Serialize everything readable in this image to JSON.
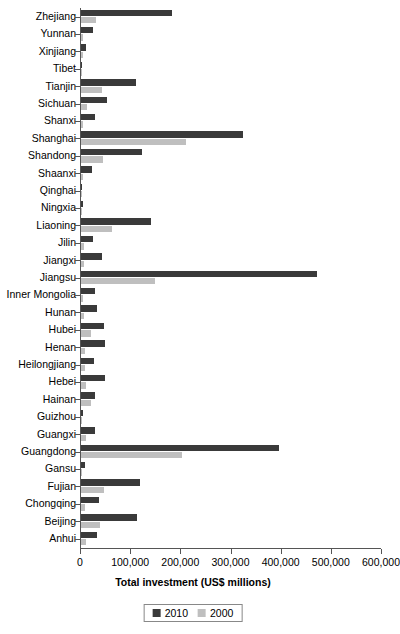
{
  "chart_data": {
    "type": "bar",
    "orientation": "horizontal",
    "title": "",
    "xlabel": "Total investment (US$ millions)",
    "ylabel": "",
    "xlim": [
      0,
      600000
    ],
    "xticks": [
      0,
      100000,
      200000,
      300000,
      400000,
      500000,
      600000
    ],
    "xtick_labels": [
      "0",
      "100,000",
      "200,000",
      "300,000",
      "400,000",
      "500,000",
      "600,000"
    ],
    "grid": false,
    "legend_position": "bottom-center",
    "categories": [
      "Zhejiang",
      "Yunnan",
      "Xinjiang",
      "Tibet",
      "Tianjin",
      "Sichuan",
      "Shanxi",
      "Shanghai",
      "Shandong",
      "Shaanxi",
      "Qinghai",
      "Ningxia",
      "Liaoning",
      "Jilin",
      "Jiangxi",
      "Jiangsu",
      "Inner Mongolia",
      "Hunan",
      "Hubei",
      "Henan",
      "Heilongjiang",
      "Hebei",
      "Hainan",
      "Guizhou",
      "Guangxi",
      "Guangdong",
      "Gansu",
      "Fujian",
      "Chongqing",
      "Beijing",
      "Anhui"
    ],
    "series": [
      {
        "name": "2010",
        "color": "#3a3a3a",
        "values": [
          182000,
          24000,
          9000,
          1500,
          110000,
          52000,
          27000,
          322000,
          122000,
          22000,
          2500,
          4000,
          140000,
          24000,
          42000,
          470000,
          27000,
          31000,
          46000,
          48000,
          26000,
          47000,
          28000,
          3000,
          28000,
          394000,
          7000,
          118000,
          35000,
          112000,
          32000
        ]
      },
      {
        "name": "2000",
        "color": "#bfbfbf",
        "values": [
          30000,
          4000,
          3000,
          400,
          42000,
          12000,
          4000,
          210000,
          44000,
          4000,
          600,
          1000,
          62000,
          6000,
          6000,
          148000,
          4000,
          5000,
          20000,
          7000,
          8000,
          10000,
          20000,
          1500,
          9000,
          202000,
          2500,
          46000,
          8000,
          38000,
          9000
        ]
      }
    ]
  },
  "legend": {
    "items": [
      {
        "label": "2010",
        "color": "#3a3a3a"
      },
      {
        "label": "2000",
        "color": "#bfbfbf"
      }
    ]
  }
}
